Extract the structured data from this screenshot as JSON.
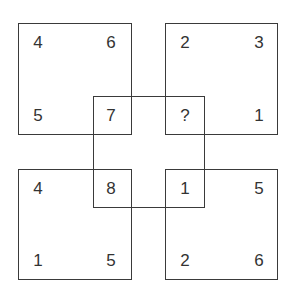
{
  "puzzle": {
    "squares": {
      "top_left": {
        "tl": "4",
        "tr": "6",
        "bl": "5",
        "br": "7"
      },
      "top_right": {
        "tl": "2",
        "tr": "3",
        "bl": "?",
        "br": "1"
      },
      "bottom_left": {
        "tl": "4",
        "tr": "8",
        "bl": "1",
        "br": "5"
      },
      "bottom_right": {
        "tl": "1",
        "tr": "5",
        "bl": "2",
        "br": "6"
      }
    },
    "center_square": {
      "tl": "7",
      "tr": "?",
      "bl": "8",
      "br": "1"
    },
    "colors": {
      "line": "#3a3a3a",
      "text": "#333333",
      "background": "#ffffff"
    }
  }
}
